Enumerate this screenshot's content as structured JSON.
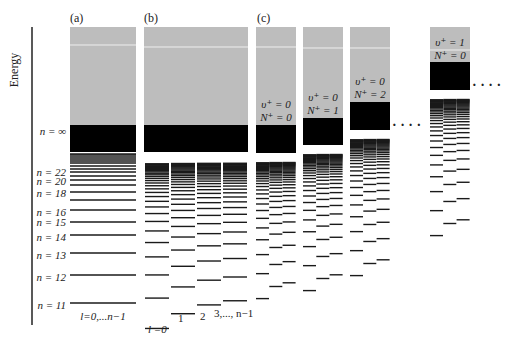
{
  "axis": {
    "label": "Energy"
  },
  "colors": {
    "continuum": "#bdbdbd",
    "bound": "#000000",
    "level": "#1a1a1a",
    "text": "#222222"
  },
  "panels": {
    "a": {
      "label": "(a)",
      "sublabel": "l=0,...n−1"
    },
    "b": {
      "label": "(b)",
      "sublabels": [
        "l =0",
        "1",
        "2",
        "3,..., n−1"
      ]
    },
    "c": {
      "label": "(c)",
      "columns": [
        {
          "v": "υ⁺ = 0",
          "N": "N⁺ = 0"
        },
        {
          "v": "υ⁺ = 0",
          "N": "N⁺ = 1"
        },
        {
          "v": "υ⁺ = 0",
          "N": "N⁺ = 2"
        },
        {
          "v": "υ⁺ = 1",
          "N": "N⁺ = 0"
        }
      ],
      "ellipsis": "· · · ·"
    }
  },
  "n_labels": [
    {
      "text": "n = ∞",
      "y": 131
    },
    {
      "text": "n = 22",
      "y": 172
    },
    {
      "text": "n = 20",
      "y": 181
    },
    {
      "text": "n = 18",
      "y": 193
    },
    {
      "text": "n = 16",
      "y": 212
    },
    {
      "text": "n = 15",
      "y": 222
    },
    {
      "text": "n = 14",
      "y": 237
    },
    {
      "text": "n = 13",
      "y": 255
    },
    {
      "text": "n = 12",
      "y": 277
    },
    {
      "text": "n = 11",
      "y": 305
    }
  ],
  "levels_a": [
    303,
    275,
    253,
    235,
    222,
    210,
    200,
    192,
    185,
    180,
    176,
    172,
    169,
    166,
    163,
    161,
    159,
    157,
    155,
    154
  ]
}
